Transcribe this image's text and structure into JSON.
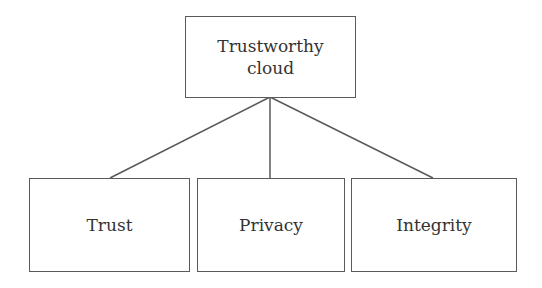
{
  "diagram": {
    "type": "tree",
    "root": {
      "id": "trustworthy-cloud",
      "label_line1": "Trustworthy",
      "label_line2": "cloud"
    },
    "children": [
      {
        "id": "trust",
        "label": "Trust"
      },
      {
        "id": "privacy",
        "label": "Privacy"
      },
      {
        "id": "integrity",
        "label": "Integrity"
      }
    ],
    "edges": [
      {
        "from": "trustworthy-cloud",
        "to": "trust"
      },
      {
        "from": "trustworthy-cloud",
        "to": "privacy"
      },
      {
        "from": "trustworthy-cloud",
        "to": "integrity"
      }
    ],
    "colors": {
      "stroke": "#5a5a5a",
      "text": "#333333",
      "background": "#ffffff"
    }
  }
}
